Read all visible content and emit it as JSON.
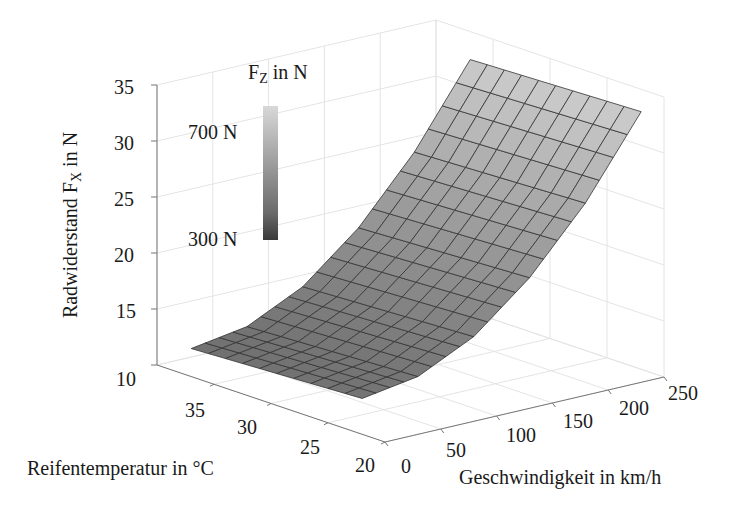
{
  "chart_data": {
    "type": "surface3d",
    "title": "",
    "xlabel": "Geschwindigkeit in km/h",
    "ylabel": "Reifentemperatur in °C",
    "zlabel": "Radwiderstand F_X in N",
    "colorbar": {
      "title": "F_Z in N",
      "labels": [
        "700 N",
        "300 N"
      ],
      "min": 300,
      "max": 700,
      "colormap": "gray"
    },
    "x_ticks": [
      0,
      50,
      100,
      150,
      200,
      250
    ],
    "y_ticks": [
      20,
      25,
      30,
      35
    ],
    "z_ticks": [
      10,
      15,
      20,
      25,
      30,
      35
    ],
    "xlim": [
      0,
      250
    ],
    "ylim": [
      20,
      40
    ],
    "zlim": [
      10,
      35
    ],
    "grid": true,
    "surface": {
      "speed_kmh": [
        0,
        50,
        100,
        150,
        200,
        250
      ],
      "tire_temp_C": [
        22,
        37
      ],
      "Fx_N": [
        [
          13.2,
          14.0,
          16.4,
          20.5,
          26.0,
          33.0
        ],
        [
          12.5,
          13.3,
          15.7,
          19.8,
          25.4,
          32.5
        ]
      ],
      "grid_lines_speed": 21,
      "grid_lines_temp": 11
    }
  },
  "labels": {
    "zlabel_main": "Radwiderstand F",
    "zlabel_sub": "X",
    "zlabel_tail": " in N",
    "colorbar_main": "F",
    "colorbar_sub": "Z",
    "colorbar_tail": " in N",
    "colorbar_top": "700 N",
    "colorbar_bottom": "300 N",
    "xlabel": "Geschwindigkeit in km/h",
    "ylabel": "Reifentemperatur in °C"
  },
  "ticks": {
    "z": [
      "35",
      "30",
      "25",
      "20",
      "15",
      "10"
    ],
    "y": [
      "35",
      "30",
      "25",
      "20"
    ],
    "x": [
      "0",
      "50",
      "100",
      "150",
      "200",
      "250"
    ]
  }
}
